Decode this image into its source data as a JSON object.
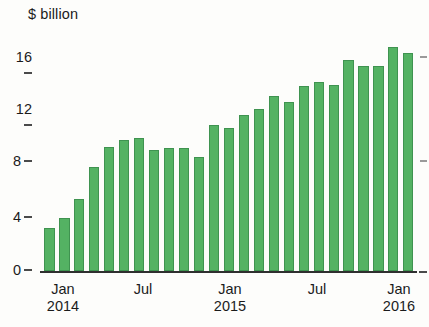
{
  "chart": {
    "unit_label": "$ billion",
    "y_ticks": [
      "16",
      "12",
      "8",
      "4",
      "0"
    ],
    "x_ticks": [
      {
        "label": "Jan",
        "year": "2014"
      },
      {
        "label": "Jul",
        "year": ""
      },
      {
        "label": "Jan",
        "year": "2015"
      },
      {
        "label": "Jul",
        "year": ""
      },
      {
        "label": "Jan",
        "year": "2016"
      }
    ],
    "bar_color": "#54b263",
    "bar_border_color": "#3f9350",
    "axis_color": "#2f2f2f"
  },
  "chart_data": {
    "type": "bar",
    "title": "",
    "subtitle": "",
    "xlabel": "",
    "ylabel": "$ billion",
    "ylim": [
      0,
      16
    ],
    "yticks": [
      0,
      4,
      8,
      12,
      16
    ],
    "grid": false,
    "legend": null,
    "categories": [
      "Jan 2014",
      "Feb 2014",
      "Mar 2014",
      "Apr 2014",
      "May 2014",
      "Jun 2014",
      "Jul 2014",
      "Aug 2014",
      "Sep 2014",
      "Oct 2014",
      "Nov 2014",
      "Dec 2014",
      "Jan 2015",
      "Feb 2015",
      "Mar 2015",
      "Apr 2015",
      "May 2015",
      "Jun 2015",
      "Jul 2015",
      "Aug 2015",
      "Sep 2015",
      "Oct 2015",
      "Nov 2015",
      "Dec 2015",
      "Jan 2016"
    ],
    "values": [
      3.0,
      3.7,
      5.0,
      7.2,
      8.6,
      9.1,
      9.2,
      8.4,
      8.5,
      8.5,
      7.9,
      10.1,
      9.9,
      10.8,
      11.2,
      12.1,
      11.7,
      12.8,
      13.1,
      12.9,
      14.6,
      14.2,
      14.2,
      15.5,
      15.1
    ]
  }
}
